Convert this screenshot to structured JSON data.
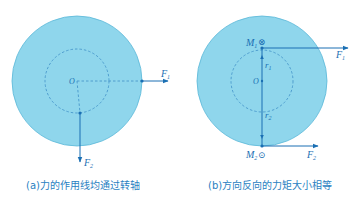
{
  "figure_a": {
    "caption": "(a)力的作用线均通过转轴",
    "center_label": "O",
    "forces": [
      {
        "name": "F",
        "sub": "1",
        "direction": "right"
      },
      {
        "name": "F",
        "sub": "2",
        "direction": "down"
      }
    ]
  },
  "figure_b": {
    "caption": "(b)方向反向的力矩大小相等",
    "center_label": "O",
    "top_point": {
      "label": "M",
      "sub": "1",
      "symbol": "⊗"
    },
    "bottom_point": {
      "label": "M",
      "sub": "2",
      "symbol": "⊙"
    },
    "radii": [
      {
        "name": "r",
        "sub": "1"
      },
      {
        "name": "r",
        "sub": "2"
      }
    ],
    "forces": [
      {
        "name": "F",
        "sub": "1",
        "direction": "right",
        "position": "top"
      },
      {
        "name": "F",
        "sub": "2",
        "direction": "right",
        "position": "bottom"
      }
    ]
  },
  "colors": {
    "disk_fill": "#8fd6ec",
    "disk_stroke": "#5bb7d8",
    "line": "#1a6fb3",
    "dashed": "#3f8fc6"
  }
}
